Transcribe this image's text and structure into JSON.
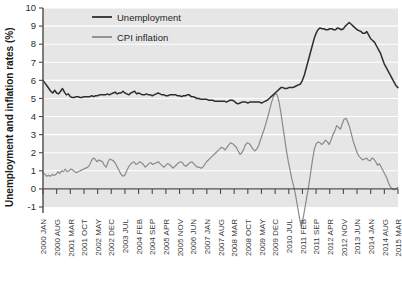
{
  "chart_data": {
    "type": "line",
    "title": "",
    "xlabel": "",
    "ylabel": "Unemployment and inflation rates (%)",
    "ylim": [
      -1,
      10
    ],
    "ytick_labels": [
      "10",
      "9",
      "8",
      "7",
      "6",
      "5",
      "4",
      "3",
      "2",
      "1",
      "0",
      "-1"
    ],
    "ytick_values": [
      10,
      9,
      8,
      7,
      6,
      5,
      4,
      3,
      2,
      1,
      0,
      -1
    ],
    "grid": true,
    "legend_position": "top-center",
    "legend": [
      "Unemployment",
      "CPI inflation"
    ],
    "colors": {
      "unemployment": "#2e2e2e",
      "cpi": "#8a8a8a",
      "plot_background": "#e6e6e6",
      "gridline": "#ffffff",
      "axis": "#4a4a4a"
    },
    "xtick_labels": [
      "2000 JAN",
      "2000 AUG",
      "2001 MAR",
      "2001 OCT",
      "2002 MAY",
      "2002 DEC",
      "2003 JUL",
      "2004 FEB",
      "2004 SEP",
      "2005 APR",
      "2005 NOV",
      "2006 JUN",
      "2007 JAN",
      "2007 AUG",
      "2008 MAR",
      "2008 OCT",
      "2009 MAY",
      "2009 DEC",
      "2010 JUL",
      "2011 FEB",
      "2011 SEP",
      "2012 APR",
      "2012 NOV",
      "2013 JUN",
      "2014 JAN",
      "2014 AUG",
      "2015 MAR"
    ],
    "x_start": "2000 JAN",
    "x_end": "2015 MAR",
    "x_index_count": 183,
    "series": [
      {
        "name": "Unemployment",
        "color": "#2e2e2e",
        "values": [
          6.0,
          5.85,
          5.7,
          5.55,
          5.4,
          5.3,
          5.45,
          5.3,
          5.25,
          5.4,
          5.55,
          5.35,
          5.2,
          5.25,
          5.1,
          5.05,
          5.05,
          5.1,
          5.1,
          5.05,
          5.05,
          5.1,
          5.1,
          5.1,
          5.1,
          5.15,
          5.1,
          5.15,
          5.15,
          5.2,
          5.2,
          5.2,
          5.2,
          5.25,
          5.2,
          5.25,
          5.3,
          5.35,
          5.25,
          5.3,
          5.3,
          5.4,
          5.3,
          5.25,
          5.2,
          5.3,
          5.35,
          5.4,
          5.25,
          5.3,
          5.25,
          5.2,
          5.2,
          5.25,
          5.2,
          5.2,
          5.15,
          5.2,
          5.25,
          5.3,
          5.25,
          5.2,
          5.2,
          5.15,
          5.15,
          5.2,
          5.2,
          5.2,
          5.2,
          5.15,
          5.15,
          5.1,
          5.15,
          5.15,
          5.2,
          5.2,
          5.1,
          5.1,
          5.05,
          5.0,
          5.0,
          4.95,
          4.95,
          4.95,
          4.95,
          4.9,
          4.9,
          4.9,
          4.85,
          4.85,
          4.85,
          4.85,
          4.85,
          4.85,
          4.8,
          4.85,
          4.9,
          4.9,
          4.85,
          4.75,
          4.7,
          4.75,
          4.8,
          4.8,
          4.8,
          4.75,
          4.8,
          4.8,
          4.8,
          4.8,
          4.8,
          4.8,
          4.75,
          4.8,
          4.85,
          4.9,
          5.0,
          5.1,
          5.2,
          5.3,
          5.4,
          5.5,
          5.6,
          5.6,
          5.55,
          5.55,
          5.6,
          5.6,
          5.6,
          5.65,
          5.7,
          5.75,
          5.8,
          6.0,
          6.3,
          6.7,
          7.1,
          7.5,
          7.9,
          8.3,
          8.6,
          8.8,
          8.9,
          8.85,
          8.85,
          8.8,
          8.8,
          8.85,
          8.85,
          8.8,
          8.8,
          8.9,
          8.85,
          8.8,
          8.85,
          9.0,
          9.1,
          9.2,
          9.1,
          9.0,
          8.9,
          8.8,
          8.75,
          8.7,
          8.6,
          8.6,
          8.7,
          8.5,
          8.3,
          8.2,
          8.1,
          7.9,
          7.7,
          7.5,
          7.2,
          6.9,
          6.7,
          6.5,
          6.3,
          6.1,
          5.9,
          5.7,
          5.6
        ]
      },
      {
        "name": "CPI inflation",
        "color": "#8a8a8a",
        "values": [
          0.9,
          0.8,
          0.7,
          0.75,
          0.7,
          0.8,
          0.75,
          0.8,
          0.95,
          0.85,
          1.0,
          0.95,
          1.1,
          0.95,
          1.0,
          1.1,
          1.05,
          0.95,
          0.9,
          0.95,
          1.0,
          1.05,
          1.1,
          1.15,
          1.2,
          1.3,
          1.55,
          1.7,
          1.65,
          1.5,
          1.6,
          1.55,
          1.5,
          1.3,
          1.2,
          1.5,
          1.65,
          1.6,
          1.55,
          1.4,
          1.2,
          1.0,
          0.8,
          0.7,
          0.75,
          1.0,
          1.2,
          1.35,
          1.45,
          1.5,
          1.35,
          1.4,
          1.5,
          1.45,
          1.35,
          1.2,
          1.3,
          1.4,
          1.45,
          1.35,
          1.4,
          1.45,
          1.5,
          1.4,
          1.3,
          1.2,
          1.3,
          1.4,
          1.35,
          1.25,
          1.15,
          1.25,
          1.35,
          1.45,
          1.5,
          1.45,
          1.3,
          1.25,
          1.35,
          1.45,
          1.5,
          1.4,
          1.3,
          1.2,
          1.2,
          1.15,
          1.2,
          1.35,
          1.5,
          1.6,
          1.7,
          1.8,
          1.9,
          2.0,
          2.1,
          2.2,
          2.3,
          2.25,
          2.15,
          2.3,
          2.45,
          2.55,
          2.5,
          2.4,
          2.3,
          2.1,
          1.9,
          2.0,
          2.2,
          2.45,
          2.55,
          2.5,
          2.35,
          2.2,
          2.1,
          2.2,
          2.4,
          2.7,
          3.0,
          3.3,
          3.65,
          4.0,
          4.4,
          4.8,
          5.1,
          5.3,
          5.2,
          4.8,
          4.2,
          3.5,
          2.8,
          2.1,
          1.5,
          1.0,
          0.5,
          0.1,
          -0.4,
          -1.0,
          -1.6,
          -2.1,
          -1.6,
          -1.0,
          -0.4,
          0.2,
          0.9,
          1.6,
          2.2,
          2.5,
          2.6,
          2.55,
          2.45,
          2.55,
          2.7,
          2.6,
          2.45,
          2.7,
          3.0,
          3.2,
          3.5,
          3.4,
          3.3,
          3.6,
          3.85,
          3.9,
          3.7,
          3.4,
          3.0,
          2.6,
          2.3,
          2.0,
          1.8,
          1.7,
          1.6,
          1.65,
          1.7,
          1.6,
          1.55,
          1.7,
          1.65,
          1.5,
          1.3,
          1.4,
          1.2,
          1.0,
          0.8,
          0.6,
          0.3,
          0.1,
          0.0,
          -0.05,
          0.0,
          0.1
        ]
      }
    ]
  }
}
